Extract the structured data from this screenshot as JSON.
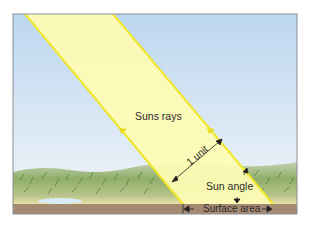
{
  "diagram": {
    "labels": {
      "rays": "Suns rays",
      "unit": "1 unit",
      "angle": "Sun angle",
      "area": "Surface area"
    },
    "colors": {
      "sky_top": "#bcd6ef",
      "sky_bottom": "#e9f1f7",
      "beam_fill": "#fdfbb4",
      "beam_edge": "#f2ea3a",
      "vegetation": "#8fae6a",
      "ground": "#a58a72",
      "frame": "#8a8f95"
    }
  }
}
